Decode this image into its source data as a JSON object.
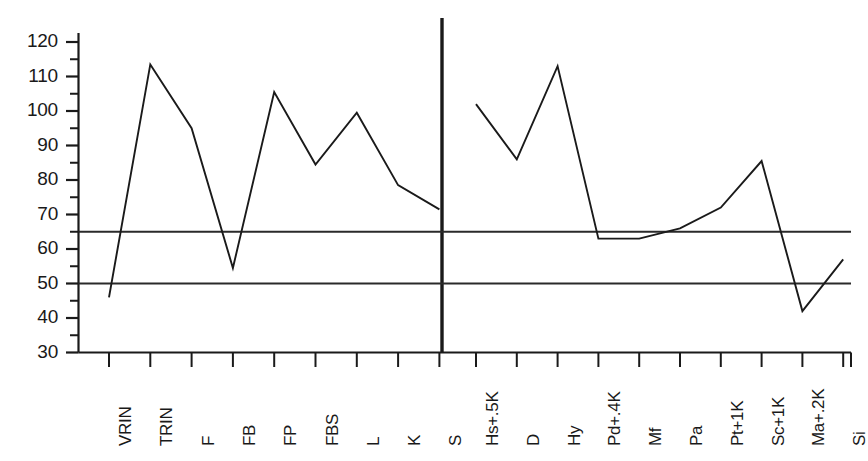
{
  "chart_data": {
    "type": "line",
    "title": "",
    "subtitle": "",
    "xlabel": "",
    "ylabel": "",
    "ylim": [
      30,
      122
    ],
    "ytick_labels": [
      "120",
      "110",
      "100",
      "90",
      "80",
      "70",
      "60",
      "50",
      "40",
      "30"
    ],
    "ytick_values": [
      120,
      110,
      100,
      90,
      80,
      70,
      60,
      50,
      40,
      30
    ],
    "ytick_minor_step": 5,
    "grid": false,
    "legend": "none",
    "reference_lines": [
      {
        "name": "upper-clinical-cutoff",
        "value": 65
      },
      {
        "name": "lower-clinical-cutoff",
        "value": 50
      }
    ],
    "panels": [
      {
        "name": "validity-scales",
        "categories": [
          "VRIN",
          "TRIN",
          "F",
          "FB",
          "FP",
          "FBS",
          "L",
          "K",
          "S"
        ],
        "values": [
          46,
          113.5,
          95,
          54.5,
          105.5,
          84.5,
          99.5,
          78.5,
          71.5
        ]
      },
      {
        "name": "clinical-scales",
        "categories": [
          "Hs+.5K",
          "D",
          "Hy",
          "Pd+.4K",
          "Mf",
          "Pa",
          "Pt+1K",
          "Sc+1K",
          "Ma+.2K",
          "Si"
        ],
        "values": [
          102,
          86,
          113,
          63,
          63,
          66,
          72,
          85.5,
          42,
          57
        ]
      }
    ]
  }
}
